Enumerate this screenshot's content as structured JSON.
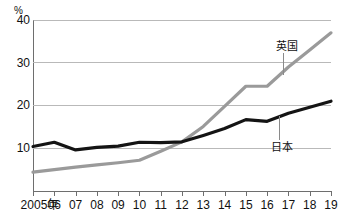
{
  "chart_data": {
    "type": "line",
    "title": "",
    "xlabel": "",
    "ylabel": "",
    "unit": "%",
    "ylim": [
      0,
      40
    ],
    "yticks": [
      40,
      30,
      20,
      10
    ],
    "grid": true,
    "legend_position": "inline-annotation",
    "categories": [
      "2005年",
      "06",
      "07",
      "08",
      "09",
      "10",
      "11",
      "12",
      "13",
      "14",
      "15",
      "16",
      "17",
      "18",
      "19"
    ],
    "x": [
      2005,
      2006,
      2007,
      2008,
      2009,
      2010,
      2011,
      2012,
      2013,
      2014,
      2015,
      2016,
      2017,
      2018,
      2019
    ],
    "series": [
      {
        "name": "英国",
        "color": "#9a9a9a",
        "values": [
          4.4,
          5.0,
          5.6,
          6.1,
          6.6,
          7.2,
          9.3,
          11.5,
          15.1,
          19.8,
          24.5,
          24.5,
          29.0,
          33.0,
          37.0
        ]
      },
      {
        "name": "日本",
        "color": "#141414",
        "values": [
          10.4,
          11.4,
          9.6,
          10.2,
          10.5,
          11.4,
          11.3,
          11.5,
          13.0,
          14.6,
          16.7,
          16.3,
          18.2,
          19.6,
          21.0
        ]
      }
    ],
    "annotations": [
      {
        "label": "英国",
        "series": "英国"
      },
      {
        "label": "日本",
        "series": "日本"
      }
    ]
  },
  "axis": {
    "unit_label": "%",
    "y_ticks": [
      "40",
      "30",
      "20",
      "10"
    ],
    "x_ticks": [
      "2005年",
      "06",
      "07",
      "08",
      "09",
      "10",
      "11",
      "12",
      "13",
      "14",
      "15",
      "16",
      "17",
      "18",
      "19"
    ]
  },
  "annotations": {
    "uk": "英国",
    "jp": "日本"
  },
  "header": {
    "title": ""
  }
}
